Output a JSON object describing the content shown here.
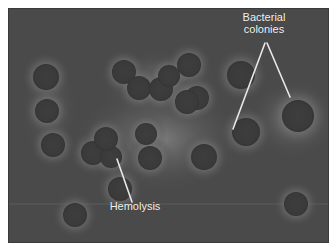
{
  "figure": {
    "colors": {
      "background": "#4a4a4a",
      "colony": "#3c3c3c",
      "halo": "#7a7a7a",
      "label_text": "#f2f2f2",
      "pointer_line": "#e8e8e8"
    }
  },
  "annotations": {
    "colonies_label_line1": "Bacterial",
    "colonies_label_line2": "colonies",
    "hemolysis_label": "Hemolysis"
  },
  "colonies": [
    {
      "cx": 37,
      "cy": 68,
      "r": 13
    },
    {
      "cx": 38,
      "cy": 102,
      "r": 12
    },
    {
      "cx": 44,
      "cy": 136,
      "r": 12
    },
    {
      "cx": 115,
      "cy": 63,
      "r": 12
    },
    {
      "cx": 130,
      "cy": 79,
      "r": 12
    },
    {
      "cx": 152,
      "cy": 80,
      "r": 12
    },
    {
      "cx": 160,
      "cy": 67,
      "r": 11
    },
    {
      "cx": 180,
      "cy": 56,
      "r": 12
    },
    {
      "cx": 188,
      "cy": 89,
      "r": 12
    },
    {
      "cx": 84,
      "cy": 144,
      "r": 12
    },
    {
      "cx": 102,
      "cy": 148,
      "r": 11
    },
    {
      "cx": 97,
      "cy": 130,
      "r": 12
    },
    {
      "cx": 137,
      "cy": 125,
      "r": 11
    },
    {
      "cx": 141,
      "cy": 149,
      "r": 12
    },
    {
      "cx": 111,
      "cy": 180,
      "r": 12
    },
    {
      "cx": 178,
      "cy": 93,
      "r": 12
    },
    {
      "cx": 237,
      "cy": 123,
      "r": 14
    },
    {
      "cx": 289,
      "cy": 107,
      "r": 16
    },
    {
      "cx": 232,
      "cy": 66,
      "r": 14
    },
    {
      "cx": 66,
      "cy": 206,
      "r": 12
    },
    {
      "cx": 287,
      "cy": 195,
      "r": 12
    },
    {
      "cx": 195,
      "cy": 148,
      "r": 13
    }
  ]
}
